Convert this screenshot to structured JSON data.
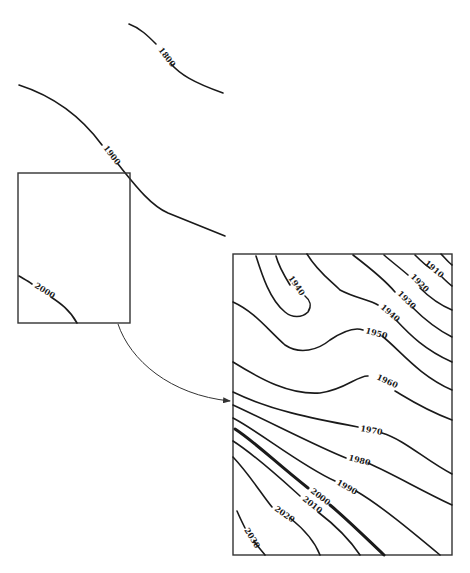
{
  "diagram": {
    "type": "contour-map-with-inset-enlargement",
    "overview": {
      "contours": [
        {
          "label": "1800"
        },
        {
          "label": "1900"
        }
      ],
      "inset_box": {
        "contours": [
          {
            "label": "2000"
          }
        ]
      }
    },
    "enlargement": {
      "contours": [
        {
          "label": "1910"
        },
        {
          "label": "1920"
        },
        {
          "label": "1930"
        },
        {
          "label": "1940"
        },
        {
          "label": "1940"
        },
        {
          "label": "1950"
        },
        {
          "label": "1960"
        },
        {
          "label": "1970"
        },
        {
          "label": "1980"
        },
        {
          "label": "1990"
        },
        {
          "label": "2000"
        },
        {
          "label": "2010"
        },
        {
          "label": "2020"
        },
        {
          "label": "2030"
        }
      ]
    },
    "connector": {
      "from": "inset_box",
      "to": "enlargement",
      "style": "curved-arrow"
    }
  },
  "colors": {
    "ink": "#1a1a1a",
    "background": "#ffffff"
  }
}
